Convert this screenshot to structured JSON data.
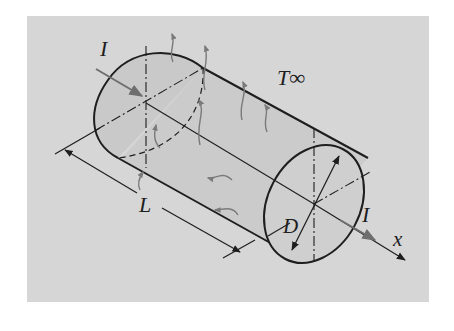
{
  "figure": {
    "labels": {
      "current_in": "I",
      "current_out": "I",
      "ambient_temperature": "T∞",
      "length": "L",
      "diameter": "D",
      "axis": "x"
    },
    "colors": {
      "panel_background": "#d6d6d6",
      "cylinder_fill": "#cccccc",
      "outline": "#1e1e1e",
      "heat_arrows": "#7a7a7a",
      "current_arrows": "#6e6e6e"
    }
  }
}
